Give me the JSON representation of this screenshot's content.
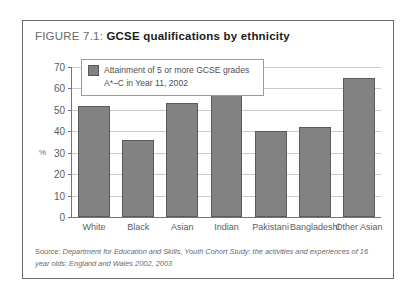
{
  "figure": {
    "label": "FIGURE 7.1:",
    "name": "GCSE qualifications by ethnicity"
  },
  "legend": {
    "text": "Attainment of 5 or more GCSE grades A*–C  in Year 11, 2002",
    "swatch_color": "#828282"
  },
  "source": {
    "lead": "Source:",
    "text": " Department for Education and Skills, Youth Cohort Study: the activities and experiences of 16 year olds: England and Wales 2002, 2003"
  },
  "axis": {
    "y_title": "%",
    "y_ticks": [
      "70",
      "60",
      "50",
      "40",
      "30",
      "20",
      "10",
      "0"
    ]
  },
  "chart_data": {
    "type": "bar",
    "title": "GCSE qualifications by ethnicity",
    "subtitle": "FIGURE 7.1:",
    "categories": [
      "White",
      "Black",
      "Asian",
      "Indian",
      "Pakistani",
      "Bangladeshi",
      "Other Asian"
    ],
    "values": [
      52,
      36,
      53,
      60,
      40,
      42,
      65
    ],
    "series": [
      {
        "name": "Attainment of 5 or more GCSE grades A*–C  in Year 11, 2002",
        "values": [
          52,
          36,
          53,
          60,
          40,
          42,
          65
        ],
        "color": "#828282"
      }
    ],
    "xlabel": "",
    "ylabel": "%",
    "ylim": [
      0,
      70
    ],
    "ytick_step": 10,
    "grid": true,
    "legend_position": "top-left-inside",
    "source": "Source: Department for Education and Skills, Youth Cohort Study: the activities and experiences of 16 year olds: England and Wales 2002, 2003"
  }
}
